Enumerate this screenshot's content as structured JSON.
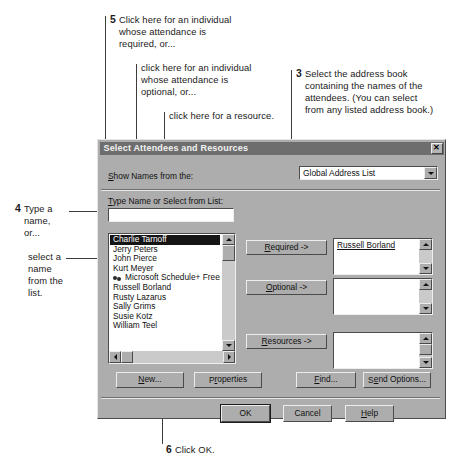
{
  "annotations": [
    {
      "id": "step5",
      "num": "5",
      "lines": [
        "Click here for an individual",
        "whose attendance is",
        "required, or..."
      ]
    },
    {
      "id": "step5b",
      "num": "",
      "lines": [
        "click here for an individual",
        "whose attendance is",
        "optional,  or..."
      ]
    },
    {
      "id": "step5c",
      "num": "",
      "lines": [
        "click here for a resource."
      ]
    },
    {
      "id": "step3",
      "num": "3",
      "lines": [
        "Select the address book",
        "containing the names of the",
        "attendees. (You can select",
        "from any listed address book.)"
      ]
    },
    {
      "id": "step4",
      "num": "4",
      "lines": [
        "Type a",
        "name,",
        "or..."
      ]
    },
    {
      "id": "step4b",
      "num": "",
      "lines": [
        "select a",
        "name",
        "from the",
        "list."
      ]
    },
    {
      "id": "step6",
      "num": "6",
      "lines": [
        "Click OK."
      ]
    }
  ],
  "dialog": {
    "title": "Select Attendees and Resources",
    "close_icon": "✕",
    "show_names_label": "Show Names from the:",
    "address_book": {
      "selected": "Global Address List",
      "arrow_icon": "chevron-down-icon"
    },
    "type_name_label": "Type Name or Select from List:",
    "name_input_value": "",
    "name_list": [
      {
        "label": "Charlie Tarnoff",
        "selected": true,
        "icon": null
      },
      {
        "label": "Jerry Peters",
        "selected": false,
        "icon": null
      },
      {
        "label": "John Pierce",
        "selected": false,
        "icon": null
      },
      {
        "label": "Kurt Meyer",
        "selected": false,
        "icon": null
      },
      {
        "label": "Microsoft Schedule+ Free/Bus",
        "selected": false,
        "icon": "group-icon"
      },
      {
        "label": "Russell Borland",
        "selected": false,
        "icon": null
      },
      {
        "label": "Rusty Lazarus",
        "selected": false,
        "icon": null
      },
      {
        "label": "Sally Grims",
        "selected": false,
        "icon": null
      },
      {
        "label": "Susie Kotz",
        "selected": false,
        "icon": null
      },
      {
        "label": "William Teel",
        "selected": false,
        "icon": null
      }
    ],
    "required_button": "Required ->",
    "optional_button": "Optional ->",
    "resources_button": "Resources ->",
    "required_list": [
      "Russell Borland"
    ],
    "optional_list": [],
    "resources_list": [],
    "new_button": "New...",
    "properties_button": "Properties",
    "find_button": "Find...",
    "send_options_button": "Send Options...",
    "ok_button": "OK",
    "cancel_button": "Cancel",
    "help_button": "Help"
  },
  "colors": {
    "dialog_face": "#adadad",
    "titlebar": "#6e6e6e",
    "field_bg": "#ffffff",
    "selection_bg": "#151515",
    "text": "#111111",
    "leader_line": "#3d3d3d"
  }
}
